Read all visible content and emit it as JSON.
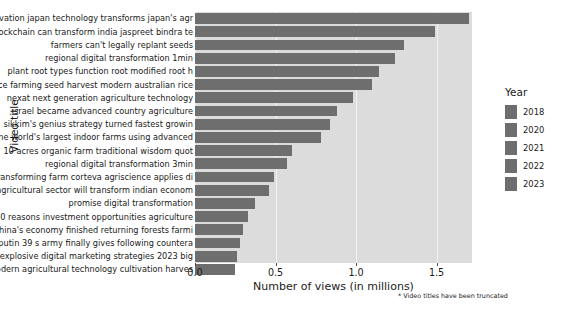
{
  "chart_data": {
    "type": "bar",
    "orientation": "horizontal",
    "title": "",
    "xlabel": "Number of views (in millions)",
    "ylabel": "Video title",
    "xlim": [
      0.0,
      1.72
    ],
    "xticks": [
      0.0,
      0.5,
      1.0,
      1.5
    ],
    "xticklabels": [
      "0.0",
      "0.5",
      "1.0",
      "1.5"
    ],
    "grid": true,
    "legend_position": "right",
    "footnote": "* Video titles have been truncated",
    "bar_color": "#6e6e6e",
    "plot_background": "#dcdcdc",
    "categories": [
      "innovation japan technology transforms japan's agr",
      "blockchain can transform india jaspreet bindra te",
      "farmers can't legally replant seeds",
      "regional digital transformation 1min",
      "plant root types function root modified root h",
      "rice farming seed harvest modern australian rice",
      "nexat next generation agriculture technology",
      "israel became advanced country agriculture",
      "sikkim's genius strategy turned fastest growin",
      "one world's largest indoor farms using advanced",
      "10 acres organic farm traditional wisdom quot",
      "regional digital transformation 3min",
      "transforming farm corteva agriscience applies di",
      "agricultural sector will transform indian econom",
      "promise digital transformation",
      "10 reasons investment opportunities agriculture",
      "china's economy finished returning forests farmi",
      "putin 39 s army finally gives following countera",
      "5 explosive digital marketing strategies 2023 big",
      "modern agricultural technology cultivation harves"
    ],
    "values": [
      1.7,
      1.49,
      1.3,
      1.24,
      1.14,
      1.1,
      0.98,
      0.88,
      0.84,
      0.78,
      0.6,
      0.57,
      0.49,
      0.46,
      0.37,
      0.33,
      0.3,
      0.28,
      0.26,
      0.25
    ]
  },
  "legend": {
    "title": "Year",
    "items": [
      {
        "label": "2018",
        "color": "#6e6e6e"
      },
      {
        "label": "2020",
        "color": "#6e6e6e"
      },
      {
        "label": "2021",
        "color": "#6e6e6e"
      },
      {
        "label": "2022",
        "color": "#6e6e6e"
      },
      {
        "label": "2023",
        "color": "#6e6e6e"
      }
    ]
  }
}
